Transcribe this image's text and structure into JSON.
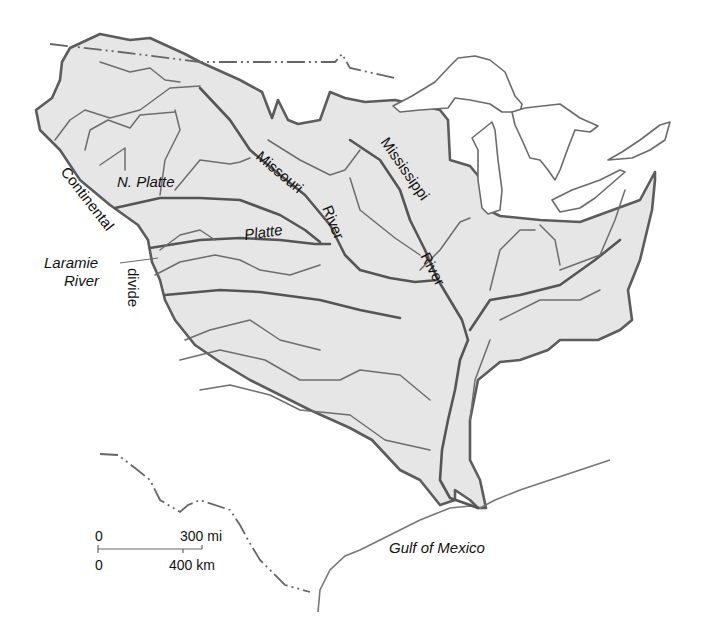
{
  "map": {
    "title": "Mississippi River drainage basin",
    "colors": {
      "basin_fill": "#e6e6e6",
      "outline": "#5c5c5c",
      "rivers": "#555555",
      "background": "#ffffff"
    },
    "labels": {
      "continental": "Continental",
      "divide": "divide",
      "n_platte": "N. Platte",
      "platte": "Platte",
      "laramie_1": "Laramie",
      "laramie_2": "River",
      "missouri_1": "Missouri",
      "missouri_2": "River",
      "mississippi_1": "Mississippi",
      "mississippi_2": "River",
      "gulf": "Gulf of Mexico"
    },
    "scale_bar": {
      "top_zero": "0",
      "top_value": "300 mi",
      "bottom_zero": "0",
      "bottom_value": "400 km"
    }
  }
}
